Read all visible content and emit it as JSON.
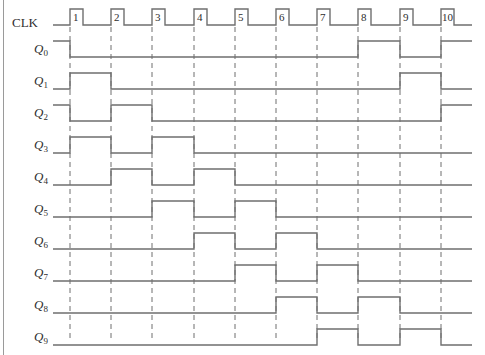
{
  "diagram": {
    "type": "timing_diagram",
    "clock": {
      "label": "CLK",
      "pulse_numbers": [
        "1",
        "2",
        "3",
        "4",
        "5",
        "6",
        "7",
        "8",
        "9",
        "10"
      ]
    },
    "signals": [
      {
        "name": "Q",
        "sub": "0",
        "initial": 1,
        "levels_after_edge": [
          0,
          0,
          0,
          0,
          0,
          0,
          0,
          1,
          0,
          1
        ]
      },
      {
        "name": "Q",
        "sub": "1",
        "initial": 0,
        "levels_after_edge": [
          1,
          0,
          0,
          0,
          0,
          0,
          0,
          0,
          1,
          0
        ]
      },
      {
        "name": "Q",
        "sub": "2",
        "initial": 1,
        "levels_after_edge": [
          0,
          1,
          0,
          0,
          0,
          0,
          0,
          0,
          0,
          1
        ]
      },
      {
        "name": "Q",
        "sub": "3",
        "initial": 0,
        "levels_after_edge": [
          1,
          0,
          1,
          0,
          0,
          0,
          0,
          0,
          0,
          0
        ]
      },
      {
        "name": "Q",
        "sub": "4",
        "initial": 0,
        "levels_after_edge": [
          0,
          1,
          0,
          1,
          0,
          0,
          0,
          0,
          0,
          0
        ]
      },
      {
        "name": "Q",
        "sub": "5",
        "initial": 0,
        "levels_after_edge": [
          0,
          0,
          1,
          0,
          1,
          0,
          0,
          0,
          0,
          0
        ]
      },
      {
        "name": "Q",
        "sub": "6",
        "initial": 0,
        "levels_after_edge": [
          0,
          0,
          0,
          1,
          0,
          1,
          0,
          0,
          0,
          0
        ]
      },
      {
        "name": "Q",
        "sub": "7",
        "initial": 0,
        "levels_after_edge": [
          0,
          0,
          0,
          0,
          1,
          0,
          1,
          0,
          0,
          0
        ]
      },
      {
        "name": "Q",
        "sub": "8",
        "initial": 0,
        "levels_after_edge": [
          0,
          0,
          0,
          0,
          0,
          1,
          0,
          1,
          0,
          0
        ]
      },
      {
        "name": "Q",
        "sub": "9",
        "initial": 0,
        "levels_after_edge": [
          0,
          0,
          0,
          0,
          0,
          0,
          1,
          0,
          1,
          0
        ]
      }
    ],
    "colors": {
      "line": "#6f6f6f",
      "text": "#2e2e2e"
    }
  }
}
